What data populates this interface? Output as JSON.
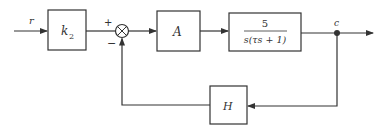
{
  "diagram": {
    "type": "control-block-diagram",
    "signals": {
      "input": "r",
      "output": "c"
    },
    "blocks": [
      {
        "id": "k2",
        "label": "k",
        "subscript": "2"
      },
      {
        "id": "A",
        "label": "A"
      },
      {
        "id": "plant",
        "numerator": "5",
        "denominator": "s(τs + 1)"
      },
      {
        "id": "H",
        "label": "H"
      }
    ],
    "summing_junction": {
      "plus_sign": "+",
      "minus_sign": "−"
    },
    "colors": {
      "stroke": "#333333",
      "background": "#ffffff"
    }
  }
}
